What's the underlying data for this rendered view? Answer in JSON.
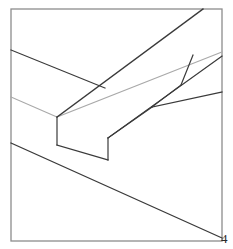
{
  "figure": {
    "background_color": "#ffffff",
    "label": {
      "text": "4",
      "x": 221,
      "y": 232,
      "color": "#2a2a2a",
      "font_size": 13
    },
    "frame": {
      "name": "border-rectangle",
      "x": 11,
      "y": 9,
      "width": 211,
      "height": 232,
      "stroke": "#8d8d8d",
      "stroke_width": 1.3,
      "fill": "none"
    },
    "palette": {
      "dark_line": "#3a3a3a",
      "mid_line": "#5a5a5a",
      "light_line": "#a9a9a9",
      "frame_line": "#8d8d8d"
    },
    "strokes": [
      {
        "name": "horizontal-member-top-edge",
        "description": "Upper long edge of the left-to-right horizontal timber, running from the left frame edge down-right",
        "points": [
          [
            11,
            50
          ],
          [
            105,
            88
          ]
        ],
        "stroke": "#3a3a3a",
        "stroke_width": 1.2
      },
      {
        "name": "horizontal-member-top-edge-continuation",
        "description": "Continuation of the horizontal timber upper edge past the diagonal beam, to the right frame edge",
        "points": [
          [
            152,
            107
          ],
          [
            222,
            92
          ]
        ],
        "stroke": "#3a3a3a",
        "stroke_width": 1.2
      },
      {
        "name": "horizontal-member-mid-edge-left",
        "description": "Light inner edge of the horizontal timber, left segment from the frame edge to the notch",
        "points": [
          [
            11,
            97
          ],
          [
            57,
            117
          ]
        ],
        "stroke": "#a9a9a9",
        "stroke_width": 1.1
      },
      {
        "name": "horizontal-member-mid-edge-right",
        "description": "Light inner edge of the horizontal timber continuing right from the notch shoulder",
        "points": [
          [
            57,
            117
          ],
          [
            222,
            52
          ]
        ],
        "stroke": "#a9a9a9",
        "stroke_width": 1.1
      },
      {
        "name": "horizontal-member-bottom-edge",
        "description": "Lower long edge of the horizontal timber, from the left frame edge sweeping down to the bottom-right",
        "points": [
          [
            11,
            143
          ],
          [
            222,
            238
          ]
        ],
        "stroke": "#3a3a3a",
        "stroke_width": 1.3
      },
      {
        "name": "diagonal-beam-upper-edge",
        "description": "Upper long edge of the diagonal beam rising from the notch shoulder to the top frame edge",
        "points": [
          [
            57,
            117
          ],
          [
            203,
            9
          ]
        ],
        "stroke": "#3a3a3a",
        "stroke_width": 1.3
      },
      {
        "name": "diagonal-beam-lower-edge",
        "description": "Lower long edge of the diagonal beam rising from the notch toe toward the right frame edge",
        "points": [
          [
            108,
            138
          ],
          [
            222,
            56
          ]
        ],
        "stroke": "#3a3a3a",
        "stroke_width": 1.2
      },
      {
        "name": "notch-left-vertical",
        "description": "Vertical cheek at the left side of the cut notch",
        "points": [
          [
            57,
            117
          ],
          [
            57,
            145
          ]
        ],
        "stroke": "#3a3a3a",
        "stroke_width": 1.2
      },
      {
        "name": "notch-bottom-edge",
        "description": "Bottom face of the cut notch running down-right",
        "points": [
          [
            57,
            145
          ],
          [
            108,
            160
          ]
        ],
        "stroke": "#3a3a3a",
        "stroke_width": 1.2
      },
      {
        "name": "notch-right-vertical",
        "description": "Vertical cheek at the right side of the cut notch",
        "points": [
          [
            108,
            160
          ],
          [
            108,
            138
          ]
        ],
        "stroke": "#3a3a3a",
        "stroke_width": 1.2
      },
      {
        "name": "notch-shoulder-to-beam",
        "description": "Short edge joining the notch right cheek to the diagonal beam lower edge",
        "points": [
          [
            108,
            138
          ],
          [
            152,
            107
          ]
        ],
        "stroke": "#3a3a3a",
        "stroke_width": 1.2
      },
      {
        "name": "right-brace-edge",
        "description": "Short edge of the right-hand brace rising from the junction to the right frame edge",
        "points": [
          [
            152,
            107
          ],
          [
            181,
            85
          ]
        ],
        "stroke": "#3a3a3a",
        "stroke_width": 1.2
      },
      {
        "name": "right-brace-end-cut",
        "description": "End-cut line of the right-hand brace above the junction",
        "points": [
          [
            181,
            85
          ],
          [
            193,
            55
          ]
        ],
        "stroke": "#3a3a3a",
        "stroke_width": 1.2
      }
    ]
  }
}
